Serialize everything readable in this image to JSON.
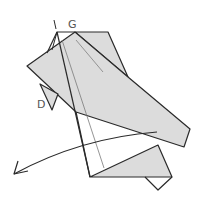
{
  "diagram": {
    "type": "origami-fold-step",
    "labels": [
      {
        "id": "label-i",
        "text": "I",
        "x": 52,
        "y": 18
      },
      {
        "id": "label-g",
        "text": "G",
        "x": 70,
        "y": 21
      },
      {
        "id": "label-d",
        "text": "D",
        "x": 38,
        "y": 100
      }
    ],
    "colors": {
      "paper_fill": "#dcdcdc",
      "stroke": "#2a2a2a",
      "crease": "#7a7a7a",
      "label": "#555555",
      "background": "#ffffff"
    },
    "arrow": {
      "kind": "curved-fold-arrow",
      "direction": "down-left"
    }
  }
}
